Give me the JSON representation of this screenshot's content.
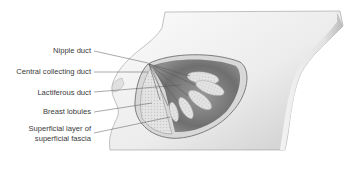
{
  "diagram": {
    "labels": [
      {
        "id": "nipple-duct",
        "text": "Nipple duct"
      },
      {
        "id": "central-collecting-duct",
        "text": "Central collecting duct"
      },
      {
        "id": "lactiferous-duct",
        "text": "Lactiferous duct"
      },
      {
        "id": "breast-lobules",
        "text": "Breast lobules"
      },
      {
        "id": "superficial-layer-line1",
        "text": "Superficial layer of"
      },
      {
        "id": "superficial-layer-line2",
        "text": "superficial fascia"
      }
    ],
    "colors": {
      "background": "#ffffff",
      "skin_light": "#f2f2f2",
      "skin_shadow": "#bdbdbd",
      "cutaway_dark": "#7a7a7a",
      "lobule": "#e6e6e6",
      "label_text": "#3a3a3a",
      "leader_line": "#555555"
    }
  }
}
